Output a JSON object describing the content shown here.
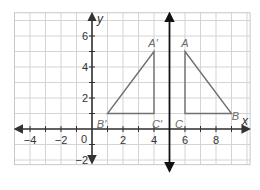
{
  "diagram": {
    "type": "coordinate-plane-reflection",
    "grid": {
      "x_min": -5,
      "x_max": 10.2,
      "y_min": -2.3,
      "y_max": 7.5,
      "unit_px": 15.5,
      "origin_px": [
        92,
        129
      ],
      "line_color": "#d4d4d4",
      "border_color": "#c8c8c8"
    },
    "axes": {
      "x_label": "x",
      "y_label": "y",
      "origin_label": "0",
      "x_ticks": [
        {
          "value": -4,
          "label": "−4"
        },
        {
          "value": -2,
          "label": "−2"
        },
        {
          "value": 2,
          "label": "2"
        },
        {
          "value": 4,
          "label": "4"
        },
        {
          "value": 6,
          "label": "6"
        },
        {
          "value": 8,
          "label": "8"
        }
      ],
      "y_ticks": [
        {
          "value": 6,
          "label": "6"
        },
        {
          "value": 4,
          "label": "4"
        },
        {
          "value": 2,
          "label": "2"
        },
        {
          "value": -2,
          "label": "−2"
        }
      ],
      "color": "#333333"
    },
    "reflection_line": {
      "x": 5,
      "color": "#111111"
    },
    "triangles": [
      {
        "name": "ABC",
        "color": "#707070",
        "vertices": [
          {
            "label": "A",
            "x": 6,
            "y": 5
          },
          {
            "label": "B",
            "x": 9,
            "y": 1
          },
          {
            "label": "C",
            "x": 6,
            "y": 1
          }
        ]
      },
      {
        "name": "A'B'C'",
        "color": "#707070",
        "vertices": [
          {
            "label": "A′",
            "x": 4,
            "y": 5
          },
          {
            "label": "B′",
            "x": 1,
            "y": 1
          },
          {
            "label": "C′",
            "x": 4,
            "y": 1
          }
        ]
      }
    ]
  }
}
